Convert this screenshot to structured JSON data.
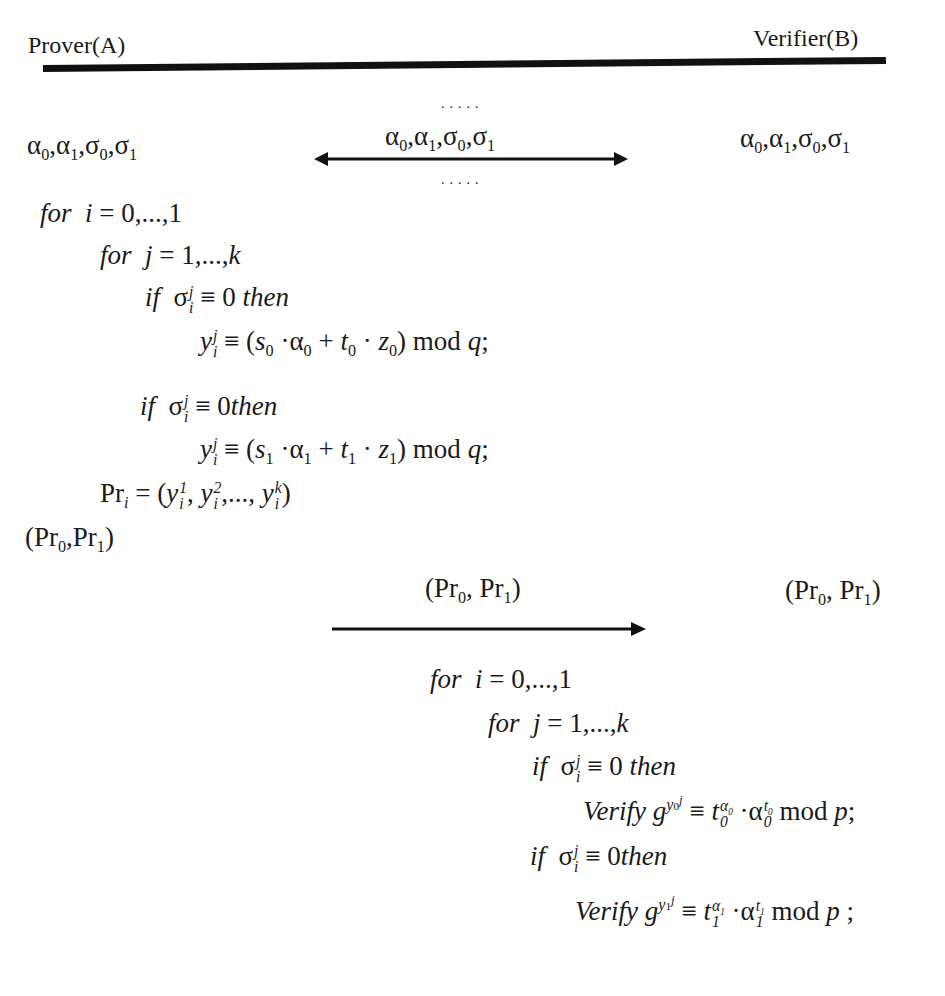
{
  "header": {
    "left_party": "Prover(A)",
    "right_party": "Verifier(B)"
  },
  "exchange1": {
    "prover_values": "α0, α1, σ0, σ1",
    "message": "α0, α1, σ0, σ1",
    "verifier_values": "α0, α1, σ0, σ1",
    "dots_above": ".....",
    "dots_below": ".....",
    "arrow": "bidirectional"
  },
  "prover_algorithm": {
    "line1": {
      "kw": "for",
      "expr": "i = 0,...,1"
    },
    "line2": {
      "kw": "for",
      "expr": "j = 1,...,k"
    },
    "line3": {
      "kw": "if",
      "cond": "σ_i^j ≡ 0",
      "kw2": "then"
    },
    "line4": {
      "lhs": "y_i^j",
      "rhs": "≡ (s0 · α0 + t0 · z0) mod q;"
    },
    "line5": {
      "kw": "if",
      "cond": "σ_i^j ≡ 0",
      "kw2": "then"
    },
    "line6": {
      "lhs": "y_i^j",
      "rhs": "≡ (s1 · α1 + t1 · z1) mod q;"
    },
    "line7": {
      "lhs": "Pr_i",
      "rhs": "= (y_i^1, y_i^2, ..., y_i^k)"
    },
    "output": "(Pr0, Pr1)"
  },
  "exchange2": {
    "message": "(Pr0, Pr1)",
    "verifier_values": "(Pr0, Pr1)",
    "arrow": "right"
  },
  "verifier_algorithm": {
    "line1": {
      "kw": "for",
      "expr": "i = 0,...,1"
    },
    "line2": {
      "kw": "for",
      "expr": "j = 1,...,k"
    },
    "line3": {
      "kw": "if",
      "cond": "σ_i^j ≡ 0",
      "kw2": "then"
    },
    "line4": {
      "kw": "Verify",
      "expr": "g^(y_0^j) ≡ t_0^(α0) · α_0^(t0) mod p;"
    },
    "line5": {
      "kw": "if",
      "cond": "σ_i^j ≡ 0",
      "kw2": "then"
    },
    "line6": {
      "kw": "Verify",
      "expr": "g^(y_1^j) ≡ t_1^(α1) · α_1^(t1) mod p ;"
    }
  },
  "tokens": {
    "for": "for",
    "if": "if",
    "then": "then",
    "verify": "Verify",
    "mod": "mod",
    "dots": "....."
  },
  "colors": {
    "ink": "#1a1a1a",
    "background": "#ffffff"
  }
}
